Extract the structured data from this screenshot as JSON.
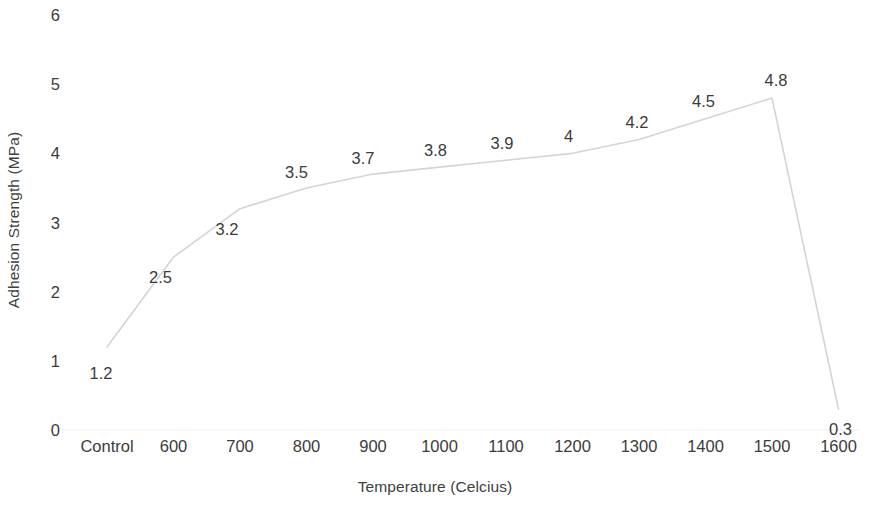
{
  "chart_data": {
    "type": "line",
    "title": "",
    "subtitle": "",
    "xlabel": "Temperature (Celcius)",
    "ylabel": "Adhesion Strength  (MPa)",
    "categories": [
      "Control",
      "600",
      "700",
      "800",
      "900",
      "1000",
      "1100",
      "1200",
      "1300",
      "1400",
      "1500",
      "1600"
    ],
    "values": [
      1.2,
      2.5,
      3.2,
      3.5,
      3.7,
      3.8,
      3.9,
      4,
      4.2,
      4.5,
      4.8,
      0.3
    ],
    "data_labels": [
      "1.2",
      "2.5",
      "3.2",
      "3.5",
      "3.7",
      "3.8",
      "3.9",
      "4",
      "4.2",
      "4.5",
      "4.8",
      "0.3"
    ],
    "ylim": [
      0,
      6
    ],
    "y_ticks": [
      "0",
      "1",
      "2",
      "3",
      "4",
      "5",
      "6"
    ],
    "y_tick_values": [
      0,
      1,
      2,
      3,
      4,
      5,
      6
    ],
    "grid": false,
    "legend": "none",
    "series": [
      {
        "name": "Adhesion Strength",
        "values": [
          1.2,
          2.5,
          3.2,
          3.5,
          3.7,
          3.8,
          3.9,
          4,
          4.2,
          4.5,
          4.8,
          0.3
        ],
        "line_color": "#d4d4d4",
        "line_width": 1.6,
        "markers": false
      }
    ],
    "axis_line_color": "#f0f0f0",
    "label_color": "#3b3b3b"
  },
  "axes": {
    "y_title": "Adhesion Strength  (MPa)",
    "x_title": "Temperature (Celcius)"
  }
}
